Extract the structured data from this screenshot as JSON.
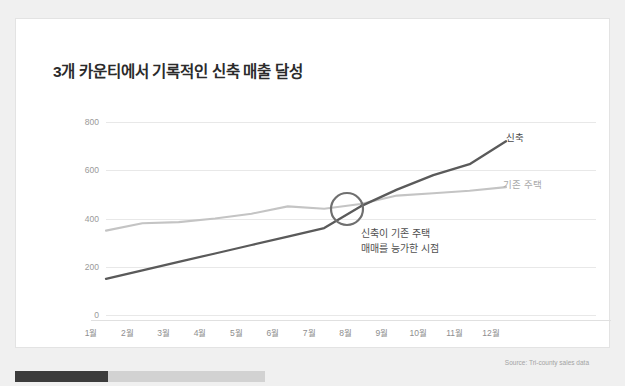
{
  "card": {
    "title": "3개 카운티에서 기록적인 신축 매출 달성",
    "source": "Source: Tri-county sales data"
  },
  "annotation": {
    "line1": "신축이 기존 주택",
    "line2": "매매를 능가한 시점",
    "marker": "crossover-circle"
  },
  "colors": {
    "series_new": "#5a5a5a",
    "series_existing": "#c4c4c4",
    "grid": "#e8e8e8",
    "title": "#2b2b2b",
    "progress_fill": "#3b3b3b",
    "progress_track": "#d2d2d2"
  },
  "progress": {
    "percent": 37
  },
  "chart_data": {
    "type": "line",
    "title": "3개 카운티에서 기록적인 신축 매출 달성",
    "xlabel": "",
    "ylabel": "",
    "categories": [
      "1월",
      "2월",
      "3월",
      "4월",
      "5월",
      "6월",
      "7월",
      "8월",
      "9월",
      "10월",
      "11월",
      "12월"
    ],
    "ylim": [
      0,
      800
    ],
    "yticks": [
      0,
      200,
      400,
      600,
      800
    ],
    "grid": true,
    "legend": "inline-right",
    "series": [
      {
        "name": "신축",
        "color": "#5a5a5a",
        "values": [
          150,
          185,
          220,
          255,
          290,
          325,
          360,
          450,
          520,
          580,
          625,
          720
        ]
      },
      {
        "name": "기존 주택",
        "color": "#c4c4c4",
        "values": [
          350,
          380,
          385,
          400,
          420,
          450,
          440,
          460,
          495,
          505,
          515,
          530
        ]
      }
    ],
    "annotations": [
      {
        "text": "신축이 기존 주택 매매를 능가한 시점",
        "at_category": "7월-8월",
        "at_value": 430,
        "marker": "circle"
      }
    ]
  }
}
